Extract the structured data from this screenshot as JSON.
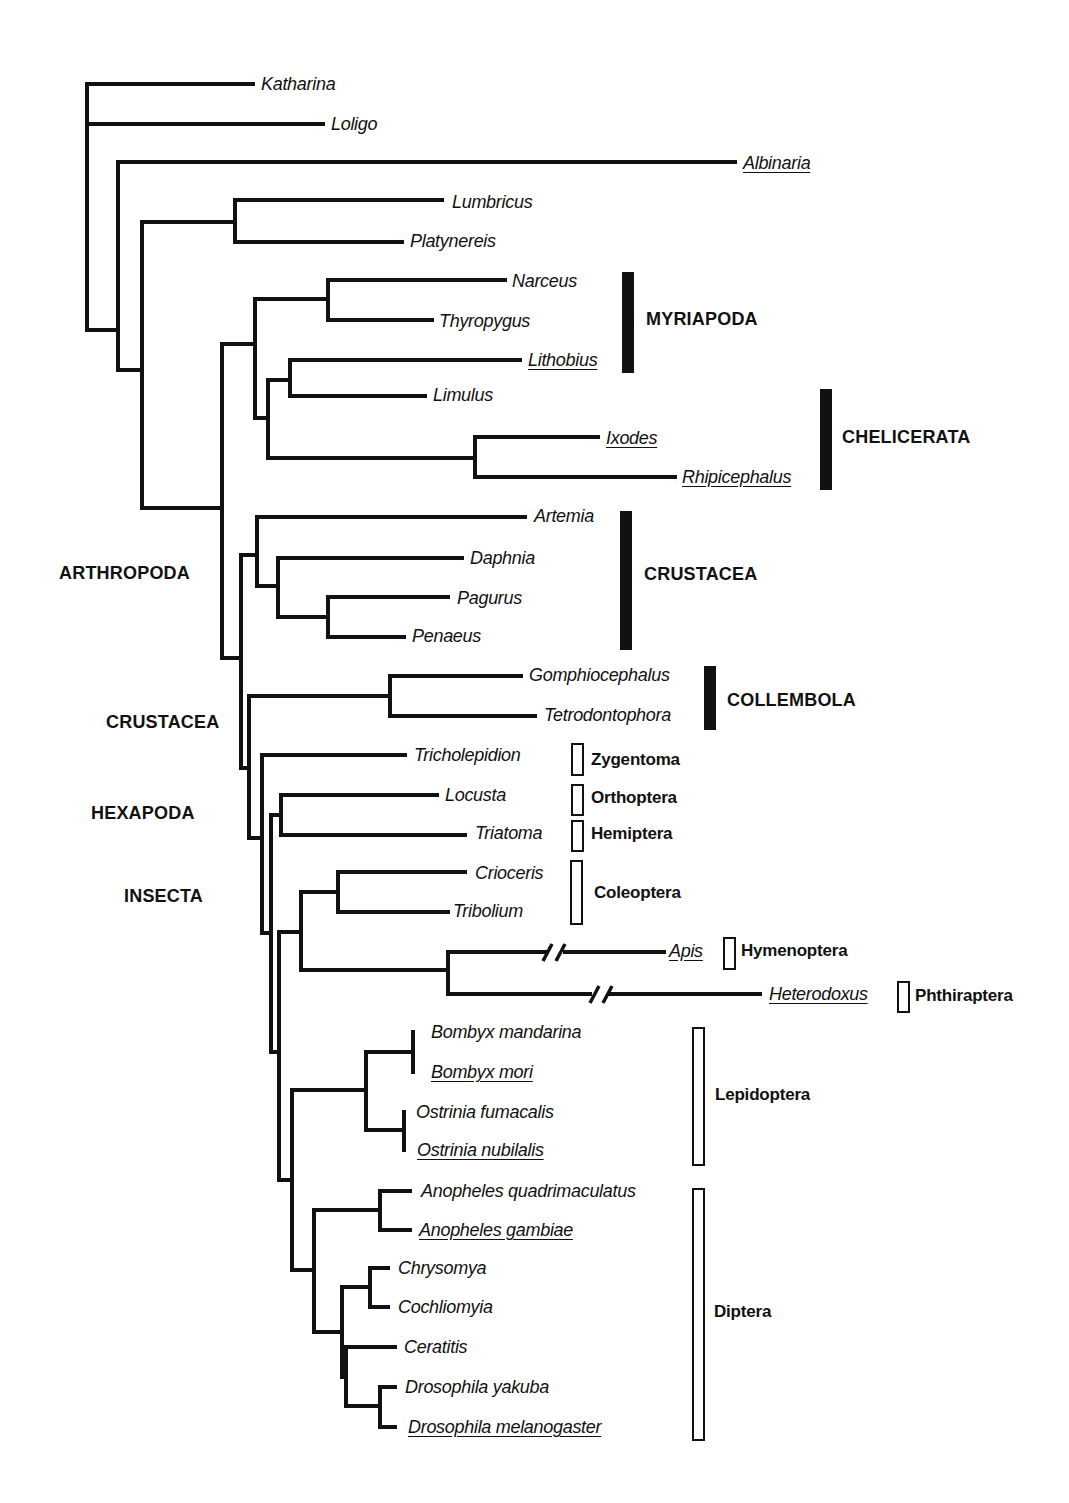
{
  "taxa": [
    {
      "name": "Katharina",
      "underlined": false
    },
    {
      "name": "Loligo",
      "underlined": false
    },
    {
      "name": "Albinaria",
      "underlined": true
    },
    {
      "name": "Lumbricus",
      "underlined": false
    },
    {
      "name": "Platynereis",
      "underlined": false
    },
    {
      "name": "Narceus",
      "underlined": false
    },
    {
      "name": "Thyropygus",
      "underlined": false
    },
    {
      "name": "Lithobius",
      "underlined": true
    },
    {
      "name": "Limulus",
      "underlined": false
    },
    {
      "name": "Ixodes",
      "underlined": true
    },
    {
      "name": "Rhipicephalus",
      "underlined": true
    },
    {
      "name": "Artemia",
      "underlined": false
    },
    {
      "name": "Daphnia",
      "underlined": false
    },
    {
      "name": "Pagurus",
      "underlined": false
    },
    {
      "name": "Penaeus",
      "underlined": false
    },
    {
      "name": "Gomphiocephalus",
      "underlined": false
    },
    {
      "name": "Tetrodontophora",
      "underlined": false
    },
    {
      "name": "Tricholepidion",
      "underlined": false
    },
    {
      "name": "Locusta",
      "underlined": false
    },
    {
      "name": "Triatoma",
      "underlined": false
    },
    {
      "name": "Crioceris",
      "underlined": false
    },
    {
      "name": "Tribolium",
      "underlined": false
    },
    {
      "name": "Apis",
      "underlined": true
    },
    {
      "name": "Heterodoxus",
      "underlined": true
    },
    {
      "name": "Bombyx mandarina",
      "underlined": false
    },
    {
      "name": "Bombyx mori",
      "underlined": true
    },
    {
      "name": "Ostrinia fumacalis",
      "underlined": false
    },
    {
      "name": "Ostrinia nubilalis",
      "underlined": true
    },
    {
      "name": "Anopheles quadrimaculatus",
      "underlined": false
    },
    {
      "name": "Anopheles gambiae",
      "underlined": true
    },
    {
      "name": "Chrysomya",
      "underlined": false
    },
    {
      "name": "Cochliomyia",
      "underlined": false
    },
    {
      "name": "Ceratitis",
      "underlined": false
    },
    {
      "name": "Drosophila yakuba",
      "underlined": false
    },
    {
      "name": "Drosophila melanogaster",
      "underlined": true
    }
  ],
  "groups_solid": [
    {
      "label": "MYRIAPODA"
    },
    {
      "label": "CHELICERATA"
    },
    {
      "label": "CRUSTACEA"
    },
    {
      "label": "COLLEMBOLA"
    }
  ],
  "orders_open": [
    {
      "label": "Zygentoma"
    },
    {
      "label": "Orthoptera"
    },
    {
      "label": "Hemiptera"
    },
    {
      "label": "Coleoptera"
    },
    {
      "label": "Hymenoptera"
    },
    {
      "label": "Phthiraptera"
    },
    {
      "label": "Lepidoptera"
    },
    {
      "label": "Diptera"
    }
  ],
  "node_labels": [
    {
      "label": "ARTHROPODA"
    },
    {
      "label": "CRUSTACEA"
    },
    {
      "label": "HEXAPODA"
    },
    {
      "label": "INSECTA"
    }
  ],
  "branch_break_marks": [
    "Apis",
    "Heterodoxus"
  ]
}
